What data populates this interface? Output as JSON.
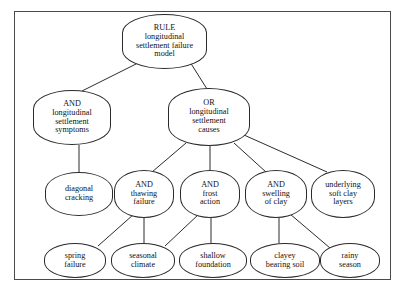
{
  "diagram": {
    "type": "fault-tree",
    "border_color": "#4a4a4a",
    "node_border_color": "#2b2b2b",
    "background": "#ffffff",
    "nodes": [
      {
        "id": "root",
        "lines": [
          "RULE",
          "longitudinal",
          "settlement failure",
          "model"
        ],
        "x": 122,
        "y": 14,
        "w": 85,
        "h": 55,
        "shape": "n-root"
      },
      {
        "id": "symptoms",
        "lines": [
          "AND",
          "longitudinal",
          "settlement",
          "symptoms"
        ],
        "x": 33,
        "y": 90,
        "w": 78,
        "h": 55,
        "shape": "n-mid"
      },
      {
        "id": "causes",
        "lines": [
          "OR",
          "longitudinal",
          "settlement",
          "causes"
        ],
        "x": 168,
        "y": 88,
        "w": 82,
        "h": 58,
        "shape": "n-mid"
      },
      {
        "id": "diagonal-cracking",
        "lines": [
          "diagonal",
          "cracking"
        ],
        "x": 45,
        "y": 172,
        "w": 68,
        "h": 44,
        "shape": "n-leaf"
      },
      {
        "id": "thawing-failure",
        "lines": [
          "AND",
          "thawing",
          "failure"
        ],
        "x": 114,
        "y": 170,
        "w": 60,
        "h": 48,
        "shape": "n-leaf"
      },
      {
        "id": "frost-action",
        "lines": [
          "AND",
          "frost",
          "action"
        ],
        "x": 180,
        "y": 170,
        "w": 60,
        "h": 48,
        "shape": "n-leaf"
      },
      {
        "id": "swelling-of-clay",
        "lines": [
          "AND",
          "swelling",
          "of clay"
        ],
        "x": 245,
        "y": 170,
        "w": 62,
        "h": 48,
        "shape": "n-leaf"
      },
      {
        "id": "underlying-soft-clay",
        "lines": [
          "underlying",
          "soft clay",
          "layers"
        ],
        "x": 311,
        "y": 170,
        "w": 64,
        "h": 48,
        "shape": "n-leaf"
      },
      {
        "id": "spring-failure",
        "lines": [
          "spring",
          "failure"
        ],
        "x": 44,
        "y": 243,
        "w": 62,
        "h": 35,
        "shape": "n-small"
      },
      {
        "id": "seasonal-climate",
        "lines": [
          "seasonal",
          "climate"
        ],
        "x": 111,
        "y": 243,
        "w": 64,
        "h": 35,
        "shape": "n-small"
      },
      {
        "id": "shallow-foundation",
        "lines": [
          "shallow",
          "foundation"
        ],
        "x": 179,
        "y": 243,
        "w": 68,
        "h": 35,
        "shape": "n-small"
      },
      {
        "id": "clayey-bearing-soil",
        "lines": [
          "clayey",
          "bearing soil"
        ],
        "x": 250,
        "y": 243,
        "w": 70,
        "h": 35,
        "shape": "n-small"
      },
      {
        "id": "rainy-season",
        "lines": [
          "rainy",
          "season"
        ],
        "x": 320,
        "y": 243,
        "w": 60,
        "h": 35,
        "shape": "n-small"
      }
    ],
    "edges": [
      {
        "from": "root",
        "to": "symptoms",
        "x1": 140,
        "y1": 62,
        "x2": 82,
        "y2": 91
      },
      {
        "from": "root",
        "to": "causes",
        "x1": 190,
        "y1": 62,
        "x2": 207,
        "y2": 89
      },
      {
        "from": "symptoms",
        "to": "diagonal-cracking",
        "x1": 79,
        "y1": 145,
        "x2": 79,
        "y2": 172
      },
      {
        "from": "causes",
        "to": "thawing-failure",
        "x1": 186,
        "y1": 143,
        "x2": 152,
        "y2": 172
      },
      {
        "from": "causes",
        "to": "frost-action",
        "x1": 210,
        "y1": 146,
        "x2": 210,
        "y2": 170
      },
      {
        "from": "causes",
        "to": "swelling-of-clay",
        "x1": 234,
        "y1": 143,
        "x2": 266,
        "y2": 172
      },
      {
        "from": "causes",
        "to": "underlying-soft-clay",
        "x1": 244,
        "y1": 135,
        "x2": 327,
        "y2": 172
      },
      {
        "from": "thawing-failure",
        "to": "spring-failure",
        "x1": 134,
        "y1": 214,
        "x2": 98,
        "y2": 246
      },
      {
        "from": "thawing-failure",
        "to": "seasonal-climate",
        "x1": 144,
        "y1": 218,
        "x2": 144,
        "y2": 243
      },
      {
        "from": "frost-action",
        "to": "seasonal-climate",
        "x1": 199,
        "y1": 214,
        "x2": 165,
        "y2": 246
      },
      {
        "from": "frost-action",
        "to": "shallow-foundation",
        "x1": 211,
        "y1": 218,
        "x2": 211,
        "y2": 243
      },
      {
        "from": "swelling-of-clay",
        "to": "clayey-bearing-soil",
        "x1": 279,
        "y1": 218,
        "x2": 279,
        "y2": 243
      },
      {
        "from": "swelling-of-clay",
        "to": "rainy-season",
        "x1": 290,
        "y1": 214,
        "x2": 330,
        "y2": 248
      }
    ]
  }
}
